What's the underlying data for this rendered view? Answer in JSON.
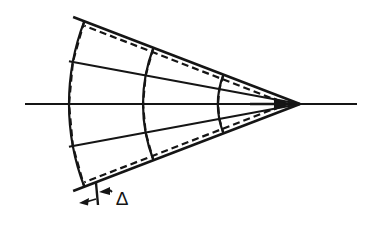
{
  "figure": {
    "kind": "technical-line-drawing",
    "background_color": "#ffffff",
    "ink_color": "#151515",
    "width": 374,
    "height": 228
  },
  "labels": {
    "delta": "Δ"
  },
  "annotation": {
    "dimension_label": "Δ",
    "dimension_label_x": 122,
    "dimension_label_y": 200,
    "tick_x": 96,
    "tick_top_y": 183,
    "tick_bottom_y": 205,
    "left_arrow_tip_x": 79,
    "left_arrow_tip_y": 203,
    "left_arrow_tail_x": 96,
    "left_arrow_tail_y": 199,
    "right_arrow_tip_x": 112,
    "right_arrow_tip_y": 192,
    "right_arrow_tail_x": 96,
    "right_arrow_tail_y": 193
  },
  "geometry": {
    "apex_x": 300,
    "apex_y": 104,
    "axis_start_x": 25,
    "axis_end_x": 357,
    "axis_y": 104,
    "arrow_tip_x": 290,
    "arrow_tip_y": 104,
    "arrow_tail_x": 250,
    "arrow_tail_y": 104,
    "half_angle_degrees": 21,
    "mid_ray_angle_degrees": 10.5,
    "arc_radii": [
      231,
      157,
      82
    ],
    "stroke_widths": {
      "outer_boundary": 2.6,
      "arc": 2.2,
      "radial": 2.0,
      "axis": 2.2,
      "dashed": 2.2,
      "annotation": 1.8
    },
    "dash_pattern": "7 4"
  },
  "chart_data": {
    "type": "line",
    "title": "",
    "xlabel": "",
    "ylabel": "",
    "grid": false,
    "legend": "none",
    "annotations": [
      {
        "text": "Δ",
        "x": 122,
        "y": 200,
        "meaning": "radial deviation between the true circular arc and its straight-chord (faceted) approximation"
      }
    ],
    "series": [
      {
        "name": "circular-arcs",
        "style": "solid",
        "radii": [
          231,
          157,
          82
        ],
        "apex": [
          300,
          104
        ],
        "angular_extent_degrees": [
          -21,
          21
        ]
      },
      {
        "name": "chord-approximations",
        "style": "dashed",
        "radii": [
          231,
          157,
          82
        ],
        "apex": [
          300,
          104
        ],
        "segment_breaks_degrees": [
          -21,
          -10.5,
          0,
          10.5,
          21
        ]
      },
      {
        "name": "radial-rays",
        "style": "solid",
        "angles_degrees": [
          -21,
          -10.5,
          0,
          10.5,
          21
        ]
      }
    ]
  }
}
